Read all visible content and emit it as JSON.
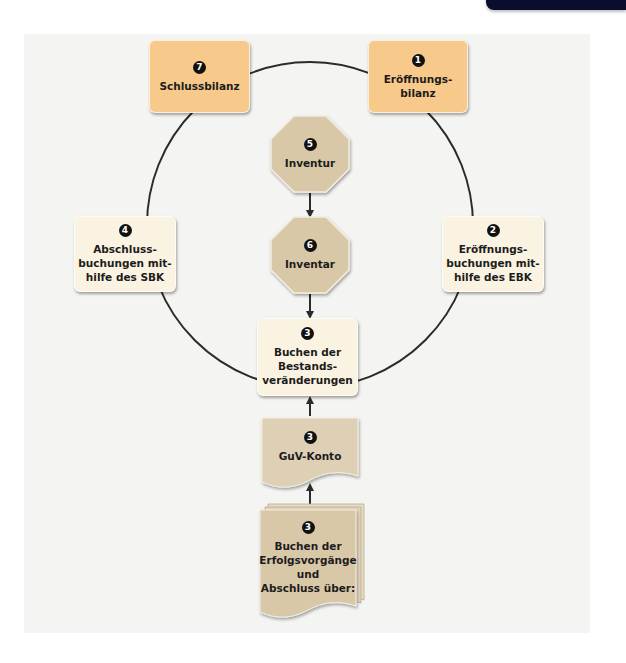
{
  "diagram": {
    "colors": {
      "panel_bg": "#f4f4f3",
      "orange_box": "#f7c98a",
      "cream_box": "#fbf3e2",
      "octagon": "#d9c8a8",
      "document": "#d9c8a8",
      "line": "#2b2b2b",
      "number_badge": "#111111",
      "corner_tab": "#0a0d2e"
    },
    "cycle": {
      "center": [
        310,
        225
      ],
      "radius": 163
    },
    "nodes": {
      "schlussbilanz": {
        "number": "7",
        "label": "Schlussbilanz"
      },
      "eroeffnungsbilanz": {
        "number": "1",
        "label": "Eröffnungs-\nbilanz"
      },
      "abschlussbuchungen": {
        "number": "4",
        "label": "Abschluss-\nbuchungen mit-\nhilfe des SBK"
      },
      "eroeffnungsbuchungen": {
        "number": "2",
        "label": "Eröffnungs-\nbuchungen mit-\nhilfe des EBK"
      },
      "inventur": {
        "number": "5",
        "label": "Inventur"
      },
      "inventar": {
        "number": "6",
        "label": "Inventar"
      },
      "bestandsveraenderungen": {
        "number": "3",
        "label": "Buchen der\nBestands-\nveränderungen"
      },
      "guv_konto": {
        "number": "3",
        "label": "GuV-Konto"
      },
      "erfolgsvorgaenge": {
        "number": "3",
        "label": "Buchen der\nErfolgsvorgänge\nund\nAbschluss über:"
      }
    },
    "arrows": [
      {
        "from": "inventur",
        "to": "inventar"
      },
      {
        "from": "inventar",
        "to": "bestandsveraenderungen"
      },
      {
        "from": "guv_konto",
        "to": "bestandsveraenderungen"
      },
      {
        "from": "erfolgsvorgaenge",
        "to": "guv_konto"
      }
    ]
  }
}
